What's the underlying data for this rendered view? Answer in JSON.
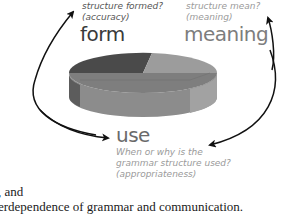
{
  "diagram": {
    "form": {
      "question_line1_partial": "grammar structure formed?",
      "question_line2": "structure formed?",
      "question_line3": "(accuracy)",
      "label": "form"
    },
    "meaning": {
      "question_line2": "structure mean?",
      "question_line3": "(meaning)",
      "label": "meaning"
    },
    "use": {
      "label": "use",
      "question_line1": "When or why is the",
      "question_line2": "grammar structure used?",
      "question_line3": "(appropriateness)"
    },
    "pie_colors": {
      "form_top": "#4a4a4a",
      "meaning_top": "#9a9a9a",
      "use_top": "#7a7a7a",
      "side_dark": "#5a5a5a",
      "side_mid": "#8a8a8a",
      "side_light": "#a8a8a8"
    },
    "arrows": [
      {
        "from": "use",
        "to": "form"
      },
      {
        "from": "meaning",
        "to": "use"
      }
    ]
  },
  "body_text": {
    "line1": ", and",
    "line2": "erdependence of grammar and communication."
  }
}
